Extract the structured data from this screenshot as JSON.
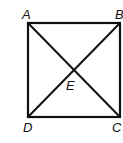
{
  "figure": {
    "shape": "square",
    "vertices": {
      "A": {
        "label": "A",
        "x": 28,
        "y": 23
      },
      "B": {
        "label": "B",
        "x": 120,
        "y": 23
      },
      "C": {
        "label": "C",
        "x": 120,
        "y": 117
      },
      "D": {
        "label": "D",
        "x": 28,
        "y": 117
      }
    },
    "intersection": {
      "label": "E"
    },
    "diagonals": [
      "AC",
      "BD"
    ],
    "stroke_color": "#111111"
  }
}
